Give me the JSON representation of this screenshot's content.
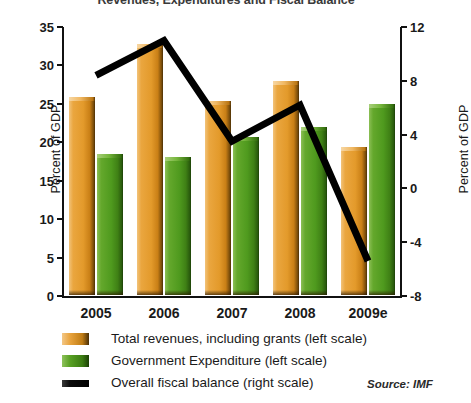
{
  "chart_data": {
    "type": "bar",
    "title": "Revenues, Expenditures and Fiscal Balance",
    "xlabel": "",
    "ylabel": "Percent of GDP",
    "y2label": "Percent of GDP",
    "categories": [
      "2005",
      "2006",
      "2007",
      "2008",
      "2009e"
    ],
    "ylim": [
      0,
      35
    ],
    "yticks": [
      0,
      5,
      10,
      15,
      20,
      25,
      30,
      35
    ],
    "y2lim": [
      -8,
      12
    ],
    "y2ticks": [
      -8,
      -4,
      0,
      4,
      8,
      12
    ],
    "grid": false,
    "legend_position": "bottom-left",
    "series": [
      {
        "name": "Total revenues, including grants (left scale)",
        "short_name": "Total revenues, including grants",
        "type": "bar",
        "axis": "left",
        "color": "#e8a33d",
        "values": [
          25.8,
          32.7,
          25.2,
          27.9,
          19.3
        ]
      },
      {
        "name": "Government Expenditure (left scale)",
        "short_name": "Government Expenditure",
        "type": "bar",
        "axis": "left",
        "color": "#4e9a22",
        "values": [
          18.4,
          18.0,
          20.6,
          21.9,
          24.8
        ]
      },
      {
        "name": "Overall fiscal balance (right scale)",
        "short_name": "Overall fiscal balance",
        "type": "line",
        "axis": "right",
        "color": "#000000",
        "values": [
          8.4,
          11.0,
          3.5,
          6.2,
          -5.4
        ]
      }
    ],
    "annotations": [
      {
        "name": "source",
        "text": "Source: IMF"
      }
    ]
  },
  "legend": {
    "items": [
      {
        "label": "Total revenues, including grants (left scale)",
        "swatch": "revenue-swatch"
      },
      {
        "label": "Government Expenditure (left scale)",
        "swatch": "expenditure-swatch"
      },
      {
        "label": "Overall fiscal balance (right scale)",
        "swatch": "balance-line-swatch"
      }
    ],
    "source": "Source: IMF"
  }
}
